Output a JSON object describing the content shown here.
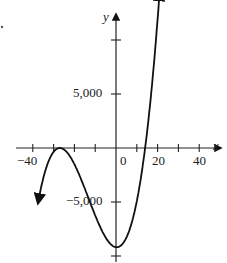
{
  "chart_data": {
    "type": "line",
    "title": "",
    "xlabel": "x",
    "ylabel": "y",
    "xlim": [
      -40,
      48
    ],
    "ylim": [
      -11000,
      12500
    ],
    "x_ticks": [
      -40,
      -30,
      -20,
      -10,
      0,
      10,
      20,
      30,
      40
    ],
    "x_tick_labels": [
      "-40",
      "0",
      "20",
      "40"
    ],
    "x_tick_label_values": [
      -40,
      0,
      20,
      40
    ],
    "y_ticks": [
      -10000,
      -5000,
      5000,
      10000
    ],
    "y_tick_labels": [
      "5,000",
      "-5,000"
    ],
    "y_tick_label_values": [
      5000,
      -5000
    ],
    "grid": false,
    "legend": null,
    "function_description": "cubic polynomial with a double root (local max touching axis) near x = -27, local min near x = 0 at about y = -9,200, and a root near x = 14; arrows at both ends",
    "series": [
      {
        "name": "f(x)",
        "coefficient": 0.9,
        "double_root": -27,
        "simple_root": 14,
        "x_start": -37.5,
        "x_end": 21,
        "points": [
          {
            "x": -37.5,
            "y": -5208
          },
          {
            "x": -35,
            "y": -2822
          },
          {
            "x": -30,
            "y": -356
          },
          {
            "x": -27,
            "y": 0
          },
          {
            "x": -20,
            "y": -1499
          },
          {
            "x": -10,
            "y": -6242
          },
          {
            "x": 0,
            "y": -9185
          },
          {
            "x": 5,
            "y": -8294
          },
          {
            "x": 10,
            "y": -4928
          },
          {
            "x": 14,
            "y": 0
          },
          {
            "x": 20,
            "y": 10540
          }
        ]
      }
    ],
    "colors": {
      "curve": "#111111",
      "axis": "#222222",
      "text": "#222222"
    }
  },
  "labels": {
    "x_axis": "x",
    "y_axis": "y",
    "x_neg40": "−40",
    "x_0": "0",
    "x_20": "20",
    "x_40": "40",
    "y_5000": "5,000",
    "y_neg5000": "−5,000"
  }
}
